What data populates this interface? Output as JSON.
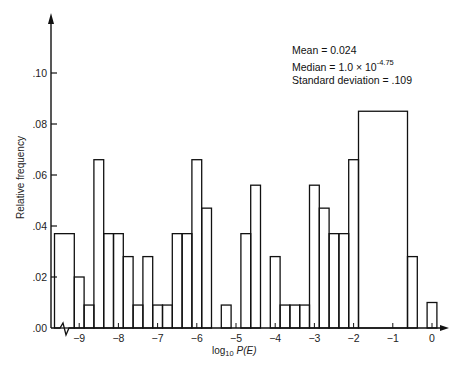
{
  "chart_data": {
    "type": "bar",
    "title": "",
    "xlabel": "log10 P(E)",
    "ylabel": "Relative frequency",
    "x_ticks": [
      -9,
      -8,
      -7,
      -6,
      -5,
      -4,
      -3,
      -2,
      -1,
      0
    ],
    "x_tick_labels": [
      "-9",
      "-8",
      "-7",
      "-6",
      "-5",
      "-4",
      "-3",
      "-2",
      "-1",
      "0"
    ],
    "y_ticks": [
      0.0,
      0.02,
      0.04,
      0.06,
      0.08,
      0.1
    ],
    "y_tick_labels": [
      ".00",
      ".02",
      ".04",
      ".06",
      ".08",
      ".10"
    ],
    "xlim": [
      -9.65,
      0.4
    ],
    "ylim": [
      0,
      0.12
    ],
    "grid": false,
    "bin_width": 0.25,
    "bins": [
      {
        "left": -9.63,
        "right": -9.125,
        "value": 0.037
      },
      {
        "left": -9.125,
        "right": -8.875,
        "value": 0.02
      },
      {
        "left": -8.875,
        "right": -8.625,
        "value": 0.009
      },
      {
        "left": -8.625,
        "right": -8.375,
        "value": 0.066
      },
      {
        "left": -8.375,
        "right": -8.125,
        "value": 0.037
      },
      {
        "left": -8.125,
        "right": -7.875,
        "value": 0.037
      },
      {
        "left": -7.875,
        "right": -7.625,
        "value": 0.028
      },
      {
        "left": -7.625,
        "right": -7.375,
        "value": 0.009
      },
      {
        "left": -7.375,
        "right": -7.125,
        "value": 0.028
      },
      {
        "left": -7.125,
        "right": -6.875,
        "value": 0.009
      },
      {
        "left": -6.875,
        "right": -6.625,
        "value": 0.009
      },
      {
        "left": -6.625,
        "right": -6.375,
        "value": 0.037
      },
      {
        "left": -6.375,
        "right": -6.125,
        "value": 0.037
      },
      {
        "left": -6.125,
        "right": -5.875,
        "value": 0.066
      },
      {
        "left": -5.875,
        "right": -5.625,
        "value": 0.047
      },
      {
        "left": -5.375,
        "right": -5.125,
        "value": 0.009
      },
      {
        "left": -4.875,
        "right": -4.625,
        "value": 0.037
      },
      {
        "left": -4.625,
        "right": -4.375,
        "value": 0.056
      },
      {
        "left": -4.125,
        "right": -3.875,
        "value": 0.028
      },
      {
        "left": -3.875,
        "right": -3.625,
        "value": 0.009
      },
      {
        "left": -3.625,
        "right": -3.375,
        "value": 0.009
      },
      {
        "left": -3.375,
        "right": -3.125,
        "value": 0.009
      },
      {
        "left": -3.125,
        "right": -2.875,
        "value": 0.056
      },
      {
        "left": -2.875,
        "right": -2.625,
        "value": 0.047
      },
      {
        "left": -2.625,
        "right": -2.375,
        "value": 0.037
      },
      {
        "left": -2.375,
        "right": -2.125,
        "value": 0.037
      },
      {
        "left": -2.125,
        "right": -1.875,
        "value": 0.066
      },
      {
        "left": -1.875,
        "right": -0.625,
        "value": 0.085
      },
      {
        "left": -0.625,
        "right": -0.375,
        "value": 0.028
      },
      {
        "left": -0.125,
        "right": 0.125,
        "value": 0.01
      }
    ],
    "annotations": [
      "Mean = 0.024",
      "Median = 1.0 × 10^-4.75",
      "Standard deviation = .109"
    ],
    "axis_break": "zigzag on x-axis near origin"
  },
  "stats": {
    "mean": "Mean  =  0.024",
    "median_prefix": "Median  =  1.0 × 10",
    "median_exp": "-4.75",
    "std": "Standard deviation  =  .109"
  },
  "labels": {
    "ylabel": "Relative frequency",
    "xlabel_prefix": "log",
    "xlabel_sub": "10",
    "xlabel_var": " P(E)"
  },
  "style": {
    "line_color": "#111111",
    "background": "#ffffff"
  }
}
